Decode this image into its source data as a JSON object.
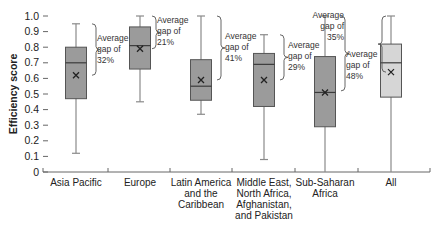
{
  "chart_data": {
    "type": "box",
    "title": "",
    "xlabel": "",
    "ylabel": "Efficiency score",
    "ylim": [
      0,
      1.0
    ],
    "yticks": [
      "0",
      "0.1",
      "0.2",
      "0.3",
      "0.4",
      "0.5",
      "0.6",
      "0.7",
      "0.8",
      "0.9",
      "1.0"
    ],
    "grid": false,
    "categories": [
      [
        "Asia Pacific"
      ],
      [
        "Europe"
      ],
      [
        "Latin America",
        "and the",
        "Caribbean"
      ],
      [
        "Middle East,",
        "North Africa,",
        "Afghanistan,",
        "and Pakistan"
      ],
      [
        "Sub-Saharan",
        "Africa"
      ],
      [
        "All"
      ]
    ],
    "series": [
      {
        "name": "Asia Pacific",
        "whisker_high": 0.95,
        "q3": 0.8,
        "median": 0.7,
        "mean": 0.62,
        "q1": 0.47,
        "whisker_low": 0.12,
        "fill": "#9b9b9b"
      },
      {
        "name": "Europe",
        "whisker_high": 1.0,
        "q3": 0.93,
        "median": 0.81,
        "mean": 0.79,
        "q1": 0.66,
        "whisker_low": 0.45,
        "fill": "#9b9b9b"
      },
      {
        "name": "Latin America and the Caribbean",
        "whisker_high": 1.0,
        "q3": 0.72,
        "median": 0.55,
        "mean": 0.59,
        "q1": 0.46,
        "whisker_low": 0.37,
        "fill": "#9b9b9b"
      },
      {
        "name": "Middle East, North Africa, Afghanistan, and Pakistan",
        "whisker_high": 0.88,
        "q3": 0.76,
        "median": 0.69,
        "mean": 0.59,
        "q1": 0.42,
        "whisker_low": 0.08,
        "fill": "#9b9b9b"
      },
      {
        "name": "Sub-Saharan Africa",
        "whisker_high": 1.0,
        "q3": 0.74,
        "median": 0.51,
        "mean": 0.51,
        "q1": 0.29,
        "whisker_low": 0.0,
        "fill": "#9b9b9b"
      },
      {
        "name": "All",
        "whisker_high": 1.0,
        "q3": 0.82,
        "median": 0.7,
        "mean": 0.64,
        "q1": 0.48,
        "whisker_low": 0.0,
        "fill": "#d6d6d6"
      }
    ],
    "annotations": [
      {
        "category": "Asia Pacific",
        "text": [
          "Average",
          "gap of",
          "32%"
        ],
        "from": 0.95,
        "to": 0.62
      },
      {
        "category": "Europe",
        "text": [
          "Average",
          "gap of",
          "21%"
        ],
        "from": 1.0,
        "to": 0.79
      },
      {
        "category": "Latin America and the Caribbean",
        "text": [
          "Average",
          "gap of",
          "41%"
        ],
        "from": 1.0,
        "to": 0.59
      },
      {
        "category": "Middle East, North Africa, Afghanistan, and Pakistan",
        "text": [
          "Average",
          "gap of",
          "29%"
        ],
        "from": 0.88,
        "to": 0.59
      },
      {
        "category": "Sub-Saharan Africa",
        "text": [
          "Average",
          "gap of",
          "48%"
        ],
        "from": 1.0,
        "to": 0.52
      },
      {
        "category": "All",
        "text": [
          "Average",
          "gap of",
          "35%"
        ],
        "from": 1.0,
        "to": 0.64
      }
    ]
  },
  "colors": {
    "box_regional": "#9b9b9b",
    "box_all": "#d6d6d6",
    "line": "#555555",
    "whisker": "#8a8a8a",
    "text": "#222222"
  }
}
